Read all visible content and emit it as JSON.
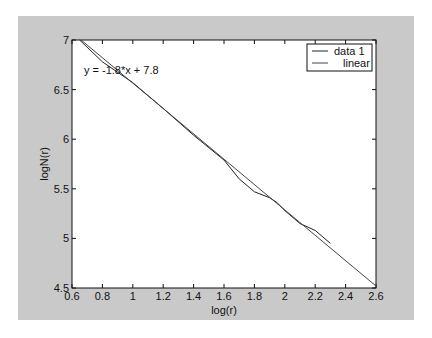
{
  "chart_data": {
    "type": "line",
    "title": "",
    "xlabel": "log(r)",
    "ylabel": "logN(r)",
    "xlim": [
      0.6,
      2.6
    ],
    "ylim": [
      4.5,
      7
    ],
    "xticks": [
      "0.6",
      "0.8",
      "1",
      "1.2",
      "1.4",
      "1.6",
      "1.8",
      "2",
      "2.2",
      "2.4",
      "2.6"
    ],
    "yticks": [
      "4.5",
      "5",
      "5.5",
      "6",
      "6.5",
      "7"
    ],
    "annotation": "y = -1.8*x + 7.8",
    "legend": [
      "data 1",
      "linear"
    ],
    "legend_position": "upper right",
    "grid": false,
    "series": [
      {
        "name": "data 1",
        "x": [
          0.65,
          0.8,
          1.0,
          1.2,
          1.4,
          1.6,
          1.7,
          1.8,
          1.9,
          1.95,
          2.0,
          2.1,
          2.2,
          2.3
        ],
        "y": [
          7.0,
          6.78,
          6.57,
          6.31,
          6.04,
          5.79,
          5.6,
          5.47,
          5.41,
          5.36,
          5.28,
          5.15,
          5.08,
          4.95
        ]
      },
      {
        "name": "linear",
        "x": [
          0.66,
          2.6
        ],
        "y": [
          7.0,
          4.52
        ]
      }
    ]
  }
}
